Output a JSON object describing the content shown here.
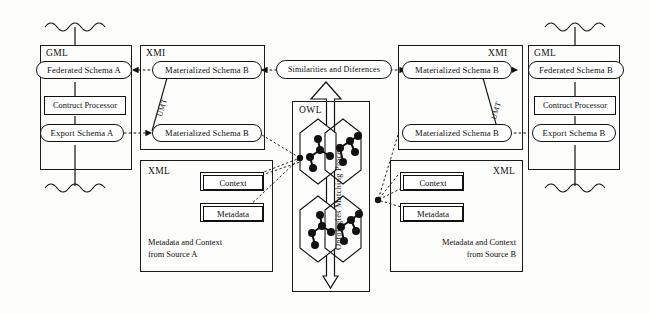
{
  "figure": {
    "type": "architecture-diagram",
    "background_color": "#fdfdfb",
    "line_color": "#111111"
  },
  "left_source": {
    "gml": {
      "label": "GML",
      "federated_schema": "Federated Schema A",
      "construct_processor": "Contruct Processor",
      "export_schema": "Export Schema A",
      "top_wave_icon": "wavy-data-source-icon",
      "bottom_wave_icon": "wavy-data-source-icon"
    },
    "xmi": {
      "label": "XMI",
      "materialized_schema_top": "Materialized Schema B",
      "materialized_schema_bottom": "Materialized Schema B",
      "transform_label": "UMT"
    },
    "xml": {
      "label": "XML",
      "context": "Context",
      "metadata": "Metadata",
      "caption": "Metadata and Context\nfrom Source A"
    }
  },
  "right_source": {
    "gml": {
      "label": "GML",
      "federated_schema": "Federated Schema B",
      "construct_processor": "Contruct Processor",
      "export_schema": "Export Schema B",
      "top_wave_icon": "wavy-data-source-icon",
      "bottom_wave_icon": "wavy-data-source-icon"
    },
    "xmi": {
      "label": "XMI",
      "materialized_schema_top": "Materialized Schema B",
      "materialized_schema_bottom": "Materialized Schema B",
      "transform_label": "UMT"
    },
    "xml": {
      "label": "XML",
      "context": "Context",
      "metadata": "Metadata",
      "caption": "Metadata and Context\nfrom Source B"
    }
  },
  "center": {
    "result_node": "Similarities and Diferences",
    "owl_label": "OWL",
    "process_label": "Ontologies Matching Process",
    "ontology_graph_count": 4,
    "graph_node_color": "#111111"
  }
}
